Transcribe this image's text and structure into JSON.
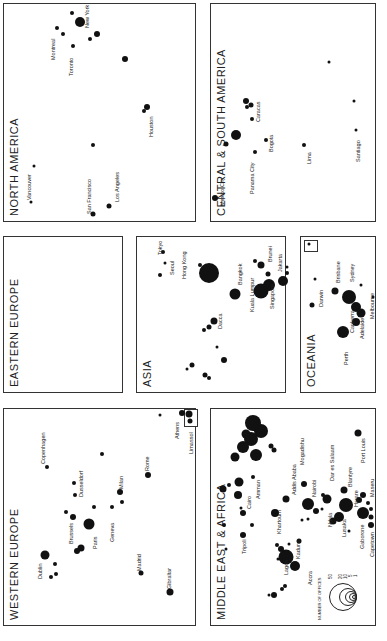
{
  "regions": {
    "north_america": {
      "title": "NORTH AMERICA",
      "cities": [
        "New York",
        "Montreal",
        "Toronto",
        "Houston",
        "Vancouver",
        "San Francisco",
        "Los Angeles"
      ]
    },
    "central_south_america": {
      "title": "CENTRAL & SOUTH AMERICA",
      "cities": [
        "Mexico City",
        "Caracas",
        "Bogota",
        "Panama City",
        "Lima",
        "Santiago"
      ]
    },
    "eastern_europe": {
      "title": "EASTERN EUROPE",
      "cities": []
    },
    "asia": {
      "title": "ASIA",
      "cities": [
        "Tokyo",
        "Seoul",
        "Hong Kong",
        "Bangkok",
        "Dacca",
        "Brunei",
        "Jakarta",
        "Kuala Lumpur",
        "Singapore"
      ]
    },
    "oceania": {
      "title": "OCEANIA",
      "cities": [
        "Darwin",
        "Brisbane",
        "Sydney",
        "Canberra",
        "Melbourne",
        "Adelaide",
        "Perth"
      ]
    },
    "western_europe": {
      "title": "WESTERN EUROPE",
      "cities": [
        "Copenhagen",
        "Dublin",
        "Brussels",
        "Dusseldorf",
        "Paris",
        "Geneva",
        "Milan",
        "Rome",
        "Madrid",
        "Gibraltar",
        "Athens",
        "Limassol"
      ]
    },
    "middle_east_africa": {
      "title": "MIDDLE EAST & AFRICA",
      "cities": [
        "Tripoli",
        "Cairo",
        "Amman",
        "Khartoum",
        "Addis Ababa",
        "Mogadishu",
        "Nairobi",
        "Dar es Salaam",
        "Port Louis",
        "Blantyre",
        "Harare",
        "Maseru",
        "Lusaka",
        "Ndola",
        "Gaborone",
        "Capetown",
        "Lagos",
        "Kaduna",
        "Accra"
      ]
    }
  },
  "legend": {
    "title": "NUMBER OF OFFICES",
    "values": [
      "50",
      "20",
      "10",
      "5",
      "1"
    ]
  }
}
